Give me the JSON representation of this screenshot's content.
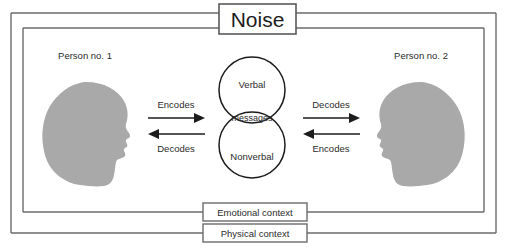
{
  "diagram": {
    "title": "Noise",
    "outer_context_label": "Physical context",
    "inner_context_label": "Emotional context",
    "left_person": {
      "label": "Person no. 1",
      "outgoing_action": "Encodes",
      "incoming_action": "Decodes",
      "icon": "head-silhouette-facing-right"
    },
    "right_person": {
      "label": "Person no. 2",
      "incoming_action": "Decodes",
      "outgoing_action": "Encodes",
      "icon": "head-silhouette-facing-left"
    },
    "venn": {
      "top_label": "Verbal",
      "overlap_label": "messages",
      "bottom_label": "Nonverbal"
    },
    "colors": {
      "head_fill": "#a9a9a9",
      "frame_stroke": "#6b6b6b",
      "circle_stroke": "#1c1c1c",
      "text": "#2b2b2b",
      "background": "#ffffff"
    }
  }
}
